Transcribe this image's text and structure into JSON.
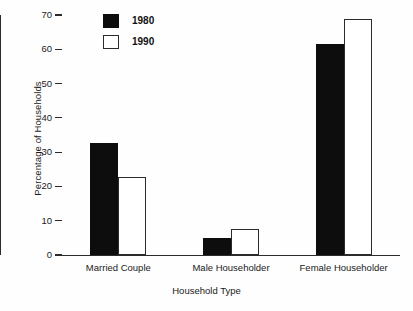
{
  "chart_data": {
    "type": "bar",
    "title": "",
    "subtitle": "",
    "xlabel": "Household Type",
    "ylabel": "Percentage of Households",
    "categories": [
      "Married Couple",
      "Male Householder",
      "Female Householder"
    ],
    "series": [
      {
        "name": "1980",
        "values": [
          32.7,
          5.0,
          61.5
        ],
        "style": "filled",
        "color": "#0d0d0d"
      },
      {
        "name": "1990",
        "values": [
          22.8,
          7.6,
          68.8
        ],
        "style": "hollow",
        "color": "#ffffff"
      }
    ],
    "ylim": [
      0,
      70
    ],
    "yticks": [
      0,
      10,
      20,
      30,
      40,
      50,
      60,
      70
    ],
    "ytick_labels": [
      "0",
      "10",
      "20",
      "30",
      "40",
      "50",
      "60",
      "70"
    ],
    "grid": false,
    "legend": {
      "position": "top-left",
      "entries": [
        "1980",
        "1990"
      ]
    }
  },
  "axes": {
    "y_title": "Percentage of Households",
    "x_title": "Household Type"
  }
}
